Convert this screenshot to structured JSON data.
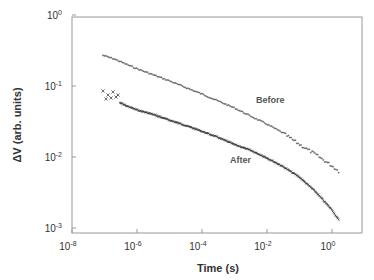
{
  "chart_data": {
    "type": "scatter",
    "title": "",
    "xlabel": "Time (s)",
    "ylabel": "ΔV (arb. units)",
    "xscale": "log",
    "yscale": "log",
    "xlim": [
      1e-08,
      10
    ],
    "ylim": [
      0.001,
      1
    ],
    "x_ticks": [
      "10^-8",
      "10^-6",
      "10^-4",
      "10^-2",
      "10^0"
    ],
    "y_ticks": [
      "10^0",
      "10^-1",
      "10^-2",
      "10^-3"
    ],
    "grid": false,
    "legend": "inline labels",
    "annotations": [
      {
        "text": "Before",
        "x": 0.01,
        "y": 0.055
      },
      {
        "text": "After",
        "x": 0.003,
        "y": 0.011
      }
    ],
    "series": [
      {
        "name": "Before",
        "marker": "+",
        "x": [
          9e-08,
          2e-07,
          5e-07,
          1e-06,
          3e-06,
          1e-05,
          3e-05,
          0.0001,
          0.0003,
          0.001,
          0.003,
          0.01,
          0.03,
          0.1,
          0.3,
          1,
          1.6
        ],
        "y": [
          0.27,
          0.24,
          0.2,
          0.175,
          0.145,
          0.118,
          0.096,
          0.077,
          0.062,
          0.049,
          0.038,
          0.029,
          0.022,
          0.015,
          0.011,
          0.0075,
          0.0063
        ]
      },
      {
        "name": "After",
        "marker": "x",
        "x": [
          9e-08,
          1.2e-07,
          1.5e-07,
          2e-07,
          2.5e-07,
          3e-07,
          5e-07,
          1e-06,
          3e-06,
          1e-05,
          3e-05,
          0.0001,
          0.0003,
          0.001,
          0.003,
          0.01,
          0.03,
          0.1,
          0.3,
          1,
          1.6
        ],
        "y": [
          0.075,
          0.065,
          0.07,
          0.06,
          0.072,
          0.058,
          0.052,
          0.046,
          0.04,
          0.033,
          0.028,
          0.023,
          0.019,
          0.015,
          0.0125,
          0.0097,
          0.0074,
          0.0052,
          0.0033,
          0.0018,
          0.0013
        ]
      }
    ]
  },
  "axes": {
    "x_title": "Time (s)",
    "y_title": "ΔV (arb. units)",
    "x_tick_labels": [
      {
        "base": "10",
        "exp": "-8"
      },
      {
        "base": "10",
        "exp": "-6"
      },
      {
        "base": "10",
        "exp": "-4"
      },
      {
        "base": "10",
        "exp": "-2"
      },
      {
        "base": "10",
        "exp": "0"
      }
    ],
    "y_tick_labels": [
      {
        "base": "10",
        "exp": "0"
      },
      {
        "base": "10",
        "exp": "-1"
      },
      {
        "base": "10",
        "exp": "-2"
      },
      {
        "base": "10",
        "exp": "-3"
      }
    ]
  },
  "labels": {
    "before": "Before",
    "after": "After"
  }
}
